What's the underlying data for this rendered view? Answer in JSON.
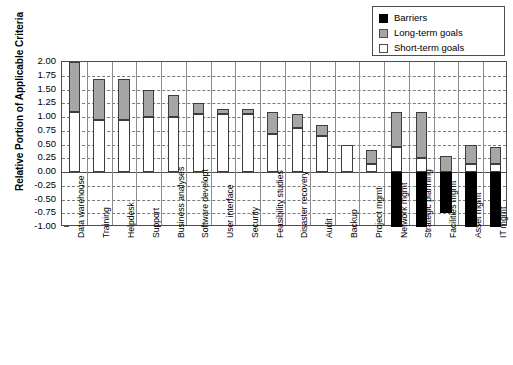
{
  "chart_data": {
    "type": "bar",
    "title": "",
    "subtitle": "",
    "xlabel": "",
    "ylabel": "Relative Portion of Applicable Criteria",
    "ylim": [
      -1.0,
      2.0
    ],
    "ytick_labels": [
      "2.00",
      "1.75",
      "1.50",
      "1.25",
      "1.00",
      "0.75",
      "0.50",
      "0.25",
      "0.00",
      "-0.25",
      "-0.50",
      "-0.75",
      "-1.00"
    ],
    "ytick_values": [
      2.0,
      1.75,
      1.5,
      1.25,
      1.0,
      0.75,
      0.5,
      0.25,
      0.0,
      -0.25,
      -0.5,
      -0.75,
      -1.0
    ],
    "grid": true,
    "stacked": true,
    "legend_position": "top-right",
    "categories": [
      "Data warehouse",
      "Training",
      "Helpdesk",
      "Support",
      "Business analyses",
      "Software developt",
      "User interface",
      "Security",
      "Feasibility studies",
      "Disaster recovery",
      "Audit",
      "Backup",
      "Project mgmt",
      "Network mgmt",
      "Strategic planning",
      "Facilities mgmt",
      "Asset mgmt",
      "IT mgmt"
    ],
    "series": [
      {
        "name": "Barriers",
        "color": "#000000",
        "values": [
          0,
          0,
          0,
          0,
          0,
          0,
          0,
          0,
          0,
          0,
          0,
          0,
          0,
          -1.0,
          -1.0,
          -0.75,
          -1.0,
          -1.0
        ]
      },
      {
        "name": "Long-term goals",
        "color": "#a6a6a6",
        "values": [
          0.9,
          0.75,
          0.75,
          0.5,
          0.4,
          0.2,
          0.1,
          0.1,
          0.4,
          0.25,
          0.2,
          0.0,
          0.25,
          0.65,
          0.85,
          0.3,
          0.35,
          0.3
        ]
      },
      {
        "name": "Short-term goals",
        "color": "#ffffff",
        "values": [
          1.1,
          0.95,
          0.95,
          1.0,
          1.0,
          1.05,
          1.05,
          1.05,
          0.7,
          0.8,
          0.65,
          0.5,
          0.15,
          0.45,
          0.25,
          0.0,
          0.15,
          0.15
        ]
      }
    ],
    "totals_positive": [
      2.0,
      1.7,
      1.7,
      1.5,
      1.4,
      1.25,
      1.15,
      1.15,
      1.1,
      1.05,
      0.85,
      0.5,
      0.4,
      1.1,
      1.1,
      0.3,
      0.5,
      0.45
    ]
  },
  "legend": {
    "items": [
      {
        "label": "Barriers",
        "swatch": "barr"
      },
      {
        "label": "Long-term goals",
        "swatch": "long"
      },
      {
        "label": "Short-term goals",
        "swatch": "short"
      }
    ]
  },
  "xaxis": {
    "title": ""
  }
}
